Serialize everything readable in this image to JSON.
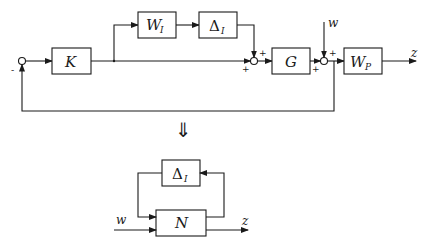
{
  "diagram": {
    "top": {
      "blocks": {
        "K": {
          "label": "K"
        },
        "WI": {
          "label": "W",
          "sub": "I"
        },
        "DeltaI": {
          "label": "Δ",
          "sub": "I"
        },
        "G": {
          "label": "G"
        },
        "WP": {
          "label": "W",
          "sub": "P"
        }
      },
      "signals": {
        "w": "w",
        "z": "z"
      },
      "signs": {
        "sum1_feedback": "-",
        "sum2_top": "+",
        "sum2_left": "+",
        "sum3_top": "+",
        "sum3_left": "+"
      }
    },
    "transform_arrow": "⇓",
    "bottom": {
      "blocks": {
        "DeltaI": {
          "label": "Δ",
          "sub": "I"
        },
        "N": {
          "label": "N"
        }
      },
      "signals": {
        "w": "w",
        "z": "z"
      }
    }
  }
}
